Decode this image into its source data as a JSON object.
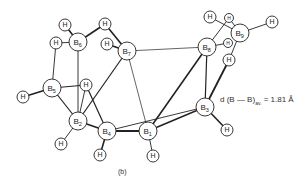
{
  "figure": {
    "caption": "(b)",
    "distance_label": {
      "prefix": "d (B — B)",
      "subscript": "av.",
      "value": "= 1.81 Å"
    }
  },
  "atoms": [
    {
      "id": "B1",
      "element": "B",
      "sub": "1",
      "x": 148,
      "y": 131,
      "r": 9
    },
    {
      "id": "B2",
      "element": "B",
      "sub": "2",
      "x": 78,
      "y": 121,
      "r": 9
    },
    {
      "id": "B3",
      "element": "B",
      "sub": "3",
      "x": 205,
      "y": 107,
      "r": 9
    },
    {
      "id": "B4",
      "element": "B",
      "sub": "4",
      "x": 107,
      "y": 131,
      "r": 9
    },
    {
      "id": "B5",
      "element": "B",
      "sub": "5",
      "x": 52,
      "y": 88,
      "r": 9
    },
    {
      "id": "B6",
      "element": "B",
      "sub": "6",
      "x": 78,
      "y": 42,
      "r": 9
    },
    {
      "id": "B7",
      "element": "B",
      "sub": "7",
      "x": 127,
      "y": 51,
      "r": 9
    },
    {
      "id": "B8",
      "element": "B",
      "sub": "8",
      "x": 207,
      "y": 47,
      "r": 9
    },
    {
      "id": "B9",
      "element": "B",
      "sub": "9",
      "x": 240,
      "y": 33,
      "r": 9
    },
    {
      "id": "H6a",
      "element": "H",
      "sub": "",
      "x": 65,
      "y": 25,
      "r": 6
    },
    {
      "id": "H6b",
      "element": "H",
      "sub": "",
      "x": 56,
      "y": 43,
      "r": 6
    },
    {
      "id": "H67",
      "element": "H",
      "sub": "",
      "x": 105,
      "y": 24,
      "r": 6
    },
    {
      "id": "H7",
      "element": "H",
      "sub": "",
      "x": 107,
      "y": 44,
      "r": 6
    },
    {
      "id": "H9a",
      "element": "H",
      "sub": "",
      "x": 210,
      "y": 17,
      "r": 6
    },
    {
      "id": "H89",
      "element": "H",
      "sub": "",
      "x": 229,
      "y": 18,
      "r": 4.5
    },
    {
      "id": "H9b",
      "element": "H",
      "sub": "",
      "x": 272,
      "y": 22,
      "r": 6
    },
    {
      "id": "H8",
      "element": "H",
      "sub": "",
      "x": 228,
      "y": 43,
      "r": 4.5
    },
    {
      "id": "H3b",
      "element": "H",
      "sub": "",
      "x": 229,
      "y": 60,
      "r": 6
    },
    {
      "id": "H5",
      "element": "H",
      "sub": "",
      "x": 23,
      "y": 97,
      "r": 6
    },
    {
      "id": "H52",
      "element": "H",
      "sub": "",
      "x": 86,
      "y": 85,
      "r": 6
    },
    {
      "id": "H2",
      "element": "H",
      "sub": "",
      "x": 61,
      "y": 144,
      "r": 6
    },
    {
      "id": "H4",
      "element": "H",
      "sub": "",
      "x": 100,
      "y": 155,
      "r": 6
    },
    {
      "id": "H1",
      "element": "H",
      "sub": "",
      "x": 153,
      "y": 156,
      "r": 6
    },
    {
      "id": "H3",
      "element": "H",
      "sub": "",
      "x": 227,
      "y": 130,
      "r": 6
    }
  ],
  "bonds": [
    [
      "B6",
      "H6a",
      1.6
    ],
    [
      "B6",
      "H6b",
      0.9
    ],
    [
      "B6",
      "H67",
      1.6
    ],
    [
      "H67",
      "B7",
      1.6
    ],
    [
      "B7",
      "H7",
      1.6
    ],
    [
      "B6",
      "B2",
      0.9
    ],
    [
      "H6b",
      "B5",
      0.9
    ],
    [
      "B5",
      "H5",
      1.6
    ],
    [
      "B5",
      "H52",
      1.2
    ],
    [
      "H52",
      "B2",
      0.9
    ],
    [
      "B5",
      "B2",
      1.2
    ],
    [
      "B2",
      "H2",
      0.9
    ],
    [
      "B2",
      "B4",
      1.6
    ],
    [
      "B4",
      "H4",
      1.6
    ],
    [
      "B4",
      "B1",
      1.8
    ],
    [
      "B1",
      "H1",
      0.9
    ],
    [
      "B1",
      "B3",
      1.6
    ],
    [
      "B4",
      "B3",
      0.9
    ],
    [
      "B3",
      "H3",
      1.6
    ],
    [
      "B7",
      "B2",
      1.2
    ],
    [
      "B7",
      "B1",
      0.7
    ],
    [
      "B7",
      "B8",
      0.7
    ],
    [
      "H52",
      "B4",
      1.2
    ],
    [
      "B8",
      "B1",
      1.6
    ],
    [
      "B8",
      "B3",
      1.2
    ],
    [
      "B8",
      "H8",
      0.9
    ],
    [
      "B8",
      "H89",
      0.9
    ],
    [
      "H89",
      "B9",
      0.9
    ],
    [
      "B9",
      "H9a",
      0.9
    ],
    [
      "B9",
      "H9b",
      0.9
    ],
    [
      "B9",
      "H3b",
      0.9
    ],
    [
      "H3b",
      "B3",
      1.8
    ]
  ]
}
